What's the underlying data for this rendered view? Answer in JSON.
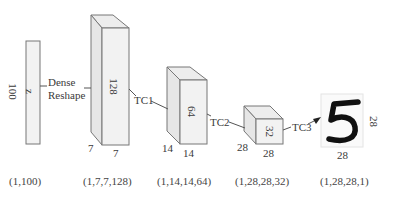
{
  "diagram": {
    "type": "neural-network-architecture",
    "nodes": [
      {
        "id": "input",
        "inner_label": "z",
        "side_label": "100",
        "shape_caption": "(1,100)"
      },
      {
        "id": "block1",
        "depth_label": "128",
        "width_label": "7",
        "height_label": "7",
        "shape_caption": "(1,7,7,128)"
      },
      {
        "id": "block2",
        "depth_label": "64",
        "width_label": "14",
        "height_label": "14",
        "shape_caption": "(1,14,14,64)"
      },
      {
        "id": "block3",
        "depth_label": "32",
        "width_label": "28",
        "height_label": "28",
        "shape_caption": "(1,28,28,32)"
      },
      {
        "id": "output",
        "image_digit": "5",
        "width_label": "28",
        "height_label": "28",
        "shape_caption": "(1,28,28,1)"
      }
    ],
    "edges": [
      {
        "from": "input",
        "to": "block1",
        "label_line1": "Dense",
        "label_line2": "Reshape"
      },
      {
        "from": "block1",
        "to": "block2",
        "label": "TC1"
      },
      {
        "from": "block2",
        "to": "block3",
        "label": "TC2"
      },
      {
        "from": "block3",
        "to": "output",
        "label": "TC3",
        "arrow": true
      }
    ]
  }
}
